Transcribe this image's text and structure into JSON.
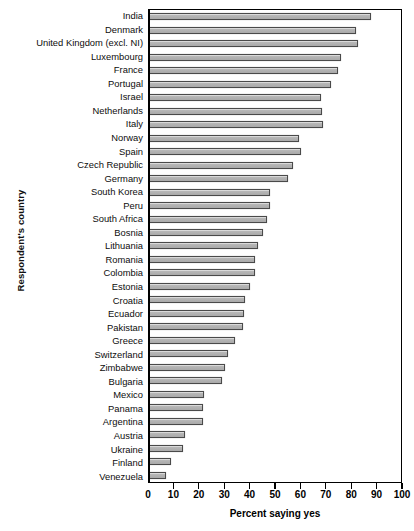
{
  "chart_data": {
    "type": "bar",
    "orientation": "horizontal",
    "title": "",
    "xlabel": "Percent saying yes",
    "ylabel": "Respondent's country",
    "xlim": [
      0,
      100
    ],
    "xticks": [
      0,
      10,
      20,
      30,
      40,
      50,
      60,
      70,
      80,
      90,
      100
    ],
    "grid": false,
    "legend": null,
    "bar_color": "#b4b4b4",
    "bar_edge_color": "#4a4a4a",
    "categories": [
      "India",
      "Denmark",
      "United Kingdom (excl. NI)",
      "Luxembourg",
      "France",
      "Portugal",
      "Israel",
      "Netherlands",
      "Italy",
      "Norway",
      "Spain",
      "Czech Republic",
      "Germany",
      "South Korea",
      "Peru",
      "South Africa",
      "Bosnia",
      "Lithuania",
      "Romania",
      "Colombia",
      "Estonia",
      "Croatia",
      "Ecuador",
      "Pakistan",
      "Greece",
      "Switzerland",
      "Zimbabwe",
      "Bulgaria",
      "Mexico",
      "Panama",
      "Argentina",
      "Austria",
      "Ukraine",
      "Finland",
      "Venezuela"
    ],
    "values": [
      88,
      82,
      83,
      76,
      75,
      72,
      68,
      68.5,
      69,
      59.5,
      60,
      57,
      55,
      47.7,
      47.7,
      46.5,
      45,
      43,
      42,
      42,
      40,
      38,
      37.5,
      37,
      34,
      31,
      30,
      28.5,
      21.5,
      21,
      21,
      14,
      13,
      8.5,
      6.5
    ]
  }
}
